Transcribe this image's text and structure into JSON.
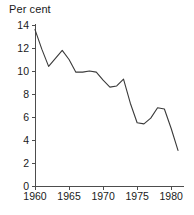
{
  "chart_data": {
    "type": "line",
    "title": "",
    "subtitle": "",
    "xlabel": "",
    "ylabel": "Per cent",
    "ylabel_position": "above-axis-left",
    "xlim": [
      1960,
      1981
    ],
    "ylim": [
      0,
      14
    ],
    "yticks": [
      0,
      2,
      4,
      6,
      8,
      10,
      12,
      14
    ],
    "ytick_labels": [
      "0",
      "2",
      "4",
      "6",
      "8",
      "10",
      "12",
      "14"
    ],
    "xticks": [
      1960,
      1965,
      1970,
      1975,
      1980
    ],
    "xtick_labels": [
      "1960",
      "1965",
      "1970",
      "1975",
      "1980"
    ],
    "grid": false,
    "legend": false,
    "legend_position": "none",
    "line_color": "#3a3a3a",
    "axis_color": "#4d4d4d",
    "background_color": "#ffffff",
    "x": [
      1960,
      1961,
      1962,
      1963,
      1964,
      1965,
      1966,
      1967,
      1968,
      1969,
      1970,
      1971,
      1972,
      1973,
      1974,
      1975,
      1976,
      1977,
      1978,
      1979,
      1980,
      1981
    ],
    "values": [
      13.6,
      11.9,
      10.4,
      11.1,
      11.8,
      11.0,
      9.9,
      9.9,
      10.0,
      9.9,
      9.2,
      8.6,
      8.7,
      9.3,
      7.2,
      5.5,
      5.4,
      5.9,
      6.8,
      6.7,
      5.0,
      3.1
    ],
    "series": [
      {
        "name": "Per cent",
        "values": [
          13.6,
          11.9,
          10.4,
          11.1,
          11.8,
          11.0,
          9.9,
          9.9,
          10.0,
          9.9,
          9.2,
          8.6,
          8.7,
          9.3,
          7.2,
          5.5,
          5.4,
          5.9,
          6.8,
          6.7,
          5.0,
          3.1
        ]
      }
    ]
  }
}
